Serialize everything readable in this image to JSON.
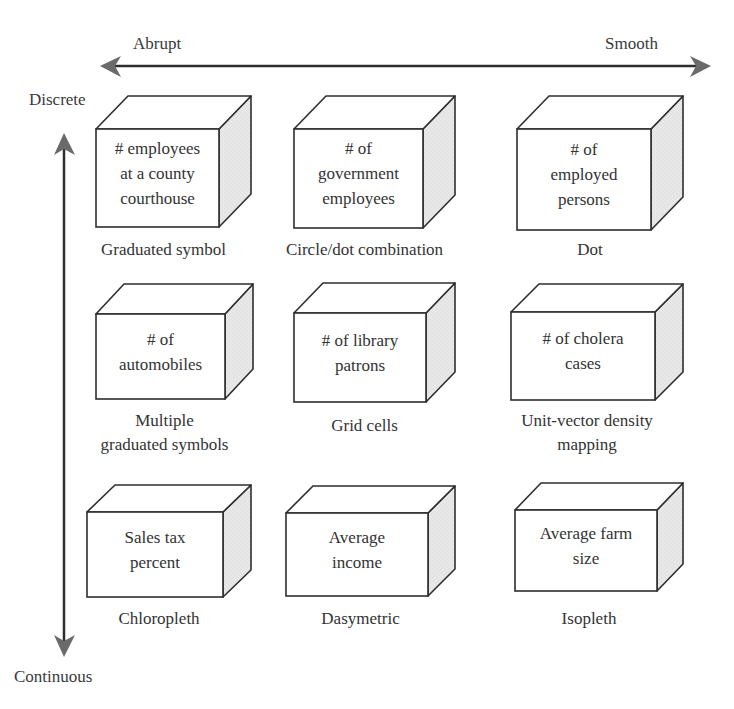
{
  "axes": {
    "horizontal": {
      "left_label": "Abrupt",
      "right_label": "Smooth"
    },
    "vertical": {
      "top_label": "Discrete",
      "bottom_label": "Continuous"
    }
  },
  "colors": {
    "line": "#2e2e2e",
    "arrowhead": "#6a6a6a",
    "side_face": "#e6e6e6",
    "top_face": "#ffffff",
    "front_face": "#ffffff"
  },
  "cells": [
    {
      "row": 1,
      "col": 1,
      "box_lines": [
        "# employees",
        "at a county",
        "courthouse"
      ],
      "caption_lines": [
        "Graduated symbol"
      ]
    },
    {
      "row": 1,
      "col": 2,
      "box_lines": [
        "# of",
        "government",
        "employees"
      ],
      "caption_lines": [
        "Circle/dot combination"
      ]
    },
    {
      "row": 1,
      "col": 3,
      "box_lines": [
        "# of",
        "employed",
        "persons"
      ],
      "caption_lines": [
        "Dot"
      ]
    },
    {
      "row": 2,
      "col": 1,
      "box_lines": [
        "# of",
        "automobiles"
      ],
      "caption_lines": [
        "Multiple",
        "graduated symbols"
      ]
    },
    {
      "row": 2,
      "col": 2,
      "box_lines": [
        "# of library",
        "patrons"
      ],
      "caption_lines": [
        "Grid cells"
      ]
    },
    {
      "row": 2,
      "col": 3,
      "box_lines": [
        "# of cholera",
        "cases"
      ],
      "caption_lines": [
        "Unit-vector density",
        "mapping"
      ]
    },
    {
      "row": 3,
      "col": 1,
      "box_lines": [
        "Sales tax",
        "percent"
      ],
      "caption_lines": [
        "Chloropleth"
      ]
    },
    {
      "row": 3,
      "col": 2,
      "box_lines": [
        "Average",
        "income"
      ],
      "caption_lines": [
        "Dasymetric"
      ]
    },
    {
      "row": 3,
      "col": 3,
      "box_lines": [
        "Average farm",
        "size"
      ],
      "caption_lines": [
        "Isopleth"
      ]
    }
  ]
}
